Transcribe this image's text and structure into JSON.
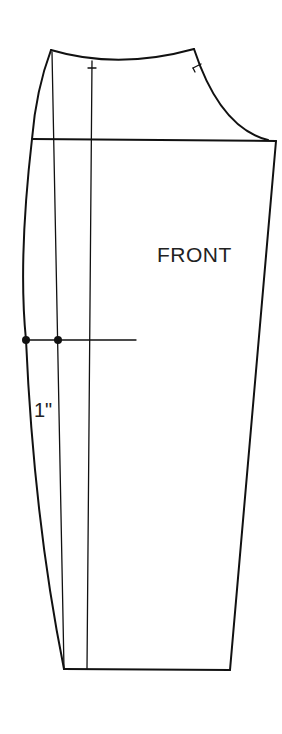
{
  "diagram": {
    "piece_label": "FRONT",
    "measurement_label": "1\"",
    "colors": {
      "line": "#111111",
      "background": "#ffffff"
    },
    "points": {
      "waist_left": [
        51,
        50
      ],
      "waist_right": [
        194,
        49
      ],
      "crotch_left": [
        32,
        139
      ],
      "crotch_right": [
        276,
        141
      ],
      "hem_left": [
        64,
        669
      ],
      "hem_right": [
        230,
        670
      ],
      "knee_dot_outer": [
        26,
        340
      ],
      "knee_dot_inner": [
        58,
        340
      ]
    }
  }
}
